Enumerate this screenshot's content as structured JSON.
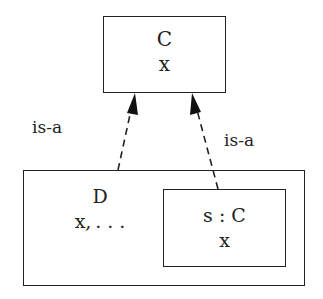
{
  "diagram": {
    "class_c": {
      "name": "C",
      "attrs": "x"
    },
    "class_d": {
      "name": "D",
      "attrs": "x, . . ."
    },
    "instance_s": {
      "name": "s : C",
      "attrs": "x"
    },
    "edges": [
      {
        "from": "D",
        "to": "C",
        "label": "is-a",
        "style": "dashed",
        "arrow": "filled"
      },
      {
        "from": "s : C",
        "to": "C",
        "label": "is-a",
        "style": "dashed",
        "arrow": "filled"
      }
    ]
  }
}
